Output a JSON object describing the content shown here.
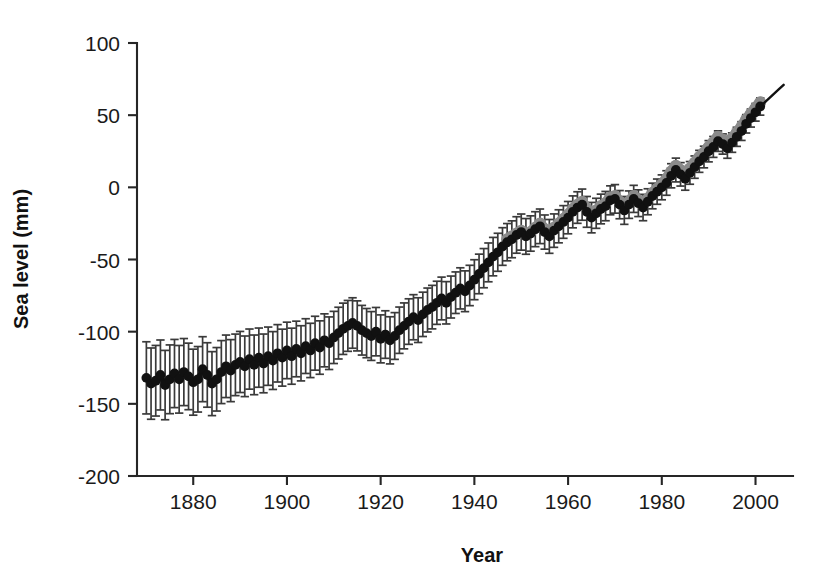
{
  "chart_data": {
    "type": "scatter",
    "title": "",
    "xlabel": "Year",
    "ylabel": "Sea level (mm)",
    "xlim": [
      1868,
      2008
    ],
    "ylim": [
      -200,
      100
    ],
    "xticks": [
      1880,
      1900,
      1920,
      1940,
      1960,
      1980,
      2000
    ],
    "yticks": [
      -200,
      -150,
      -100,
      -50,
      0,
      50,
      100
    ],
    "xtick_labels": [
      "1880",
      "1900",
      "1920",
      "1940",
      "1960",
      "1980",
      "2000"
    ],
    "ytick_labels": [
      "-200",
      "-150",
      "-100",
      "-50",
      "0",
      "50",
      "100"
    ],
    "grid": false,
    "legend": "none",
    "colors": {
      "series_tide_gauge": "#111111",
      "series_reconstruction": "#8a8a8a",
      "errorbar": "#3a3a3a",
      "trend_line": "#111111",
      "axis": "#262626",
      "background": "#ffffff"
    },
    "marker_style": "filled-circle",
    "errorbar_style": "capped-vertical",
    "series": [
      {
        "name": "Sea level with uncertainty (black markers, error bars)",
        "color": "#111111",
        "x": [
          1870,
          1871,
          1872,
          1873,
          1874,
          1875,
          1876,
          1877,
          1878,
          1879,
          1880,
          1881,
          1882,
          1883,
          1884,
          1885,
          1886,
          1887,
          1888,
          1889,
          1890,
          1891,
          1892,
          1893,
          1894,
          1895,
          1896,
          1897,
          1898,
          1899,
          1900,
          1901,
          1902,
          1903,
          1904,
          1905,
          1906,
          1907,
          1908,
          1909,
          1910,
          1911,
          1912,
          1913,
          1914,
          1915,
          1916,
          1917,
          1918,
          1919,
          1920,
          1921,
          1922,
          1923,
          1924,
          1925,
          1926,
          1927,
          1928,
          1929,
          1930,
          1931,
          1932,
          1933,
          1934,
          1935,
          1936,
          1937,
          1938,
          1939,
          1940,
          1941,
          1942,
          1943,
          1944,
          1945,
          1946,
          1947,
          1948,
          1949,
          1950,
          1951,
          1952,
          1953,
          1954,
          1955,
          1956,
          1957,
          1958,
          1959,
          1960,
          1961,
          1962,
          1963,
          1964,
          1965,
          1966,
          1967,
          1968,
          1969,
          1970,
          1971,
          1972,
          1973,
          1974,
          1975,
          1976,
          1977,
          1978,
          1979,
          1980,
          1981,
          1982,
          1983,
          1984,
          1985,
          1986,
          1987,
          1988,
          1989,
          1990,
          1991,
          1992,
          1993,
          1994,
          1995,
          1996,
          1997,
          1998,
          1999,
          2000,
          2001
        ],
        "y": [
          -132,
          -136,
          -134,
          -130,
          -137,
          -133,
          -129,
          -133,
          -128,
          -131,
          -135,
          -133,
          -126,
          -130,
          -136,
          -133,
          -128,
          -124,
          -127,
          -123,
          -121,
          -124,
          -119,
          -123,
          -118,
          -122,
          -117,
          -120,
          -115,
          -118,
          -113,
          -117,
          -112,
          -115,
          -110,
          -113,
          -108,
          -111,
          -106,
          -108,
          -104,
          -101,
          -98,
          -96,
          -94,
          -96,
          -99,
          -101,
          -103,
          -100,
          -105,
          -102,
          -106,
          -103,
          -99,
          -96,
          -93,
          -90,
          -92,
          -88,
          -85,
          -83,
          -80,
          -77,
          -80,
          -76,
          -73,
          -70,
          -72,
          -68,
          -64,
          -60,
          -56,
          -52,
          -48,
          -45,
          -41,
          -38,
          -36,
          -33,
          -31,
          -34,
          -32,
          -29,
          -27,
          -31,
          -34,
          -30,
          -27,
          -24,
          -21,
          -17,
          -14,
          -12,
          -17,
          -21,
          -18,
          -15,
          -13,
          -9,
          -8,
          -12,
          -16,
          -12,
          -8,
          -11,
          -14,
          -10,
          -6,
          -3,
          0,
          3,
          8,
          12,
          9,
          6,
          10,
          14,
          18,
          21,
          25,
          28,
          32,
          30,
          27,
          31,
          35,
          39,
          44,
          48,
          52,
          56
        ]
      },
      {
        "name": "Sea level reconstruction (grey markers, 1947 onward)",
        "color": "#8a8a8a",
        "x": [
          1947,
          1948,
          1949,
          1950,
          1951,
          1952,
          1953,
          1954,
          1955,
          1956,
          1957,
          1958,
          1959,
          1960,
          1961,
          1962,
          1963,
          1964,
          1965,
          1966,
          1967,
          1968,
          1969,
          1970,
          1971,
          1972,
          1973,
          1974,
          1975,
          1976,
          1977,
          1978,
          1979,
          1980,
          1981,
          1982,
          1983,
          1984,
          1985,
          1986,
          1987,
          1988,
          1989,
          1990,
          1991,
          1992,
          1993,
          1994,
          1995,
          1996,
          1997,
          1998,
          1999,
          2000,
          2001
        ],
        "y": [
          -36,
          -34,
          -32,
          -30,
          -33,
          -31,
          -28,
          -25,
          -29,
          -32,
          -28,
          -25,
          -22,
          -19,
          -15,
          -12,
          -10,
          -15,
          -19,
          -16,
          -13,
          -11,
          -7,
          -6,
          -10,
          -14,
          -10,
          -6,
          -9,
          -12,
          -8,
          -4,
          -1,
          2,
          6,
          11,
          15,
          12,
          9,
          13,
          17,
          21,
          24,
          28,
          31,
          35,
          33,
          30,
          34,
          38,
          42,
          47,
          51,
          55,
          59
        ]
      }
    ],
    "errorbars": {
      "series": "Sea level with uncertainty (black markers, error bars)",
      "note": "Symmetric 1-sigma bars; large near 1870 (~±25 mm) shrinking toward present (~±6 mm)",
      "sigma_start_mm": 25,
      "sigma_end_mm": 6
    },
    "trend_line": {
      "name": "Fitted trend extension",
      "color": "#111111",
      "x": [
        2001,
        2003,
        2005,
        2006
      ],
      "y": [
        56,
        62,
        68,
        71
      ]
    }
  },
  "axes": {
    "x_title": "Year",
    "y_title": "Sea level (mm)"
  }
}
